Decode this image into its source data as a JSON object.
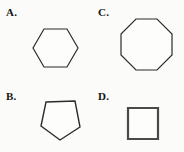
{
  "page": {
    "background_color": "#fbfbfa",
    "width": 184,
    "height": 152,
    "layout": "2x2 multiple-choice polygon grid"
  },
  "choices": [
    {
      "id": "a",
      "label": "A.",
      "shape_name": "hexagon",
      "sides": 6,
      "orientation": "flat-top, vertices at left and right",
      "stroke_color": "#2b2b2b",
      "fill_color": "#fdfdfc",
      "stroke_width": 1.2,
      "box": {
        "x": 33,
        "y": 29,
        "width": 46,
        "height": 38
      },
      "points": "11,0 34,0 45,19 34,38 11,38 0,19"
    },
    {
      "id": "c",
      "label": "C.",
      "shape_name": "octagon",
      "sides": 8,
      "orientation": "flat-top regular octagon",
      "stroke_color": "#2b2b2b",
      "fill_color": "#fdfdfc",
      "stroke_width": 1.2,
      "box": {
        "x": 121,
        "y": 19,
        "width": 51,
        "height": 51
      },
      "points": "15,0 36,0 51,15 51,36 36,51 15,51 0,36 0,15"
    },
    {
      "id": "b",
      "label": "B.",
      "shape_name": "pentagon",
      "sides": 5,
      "orientation": "flat top, apex pointing down",
      "stroke_color": "#2b2b2b",
      "fill_color": "#fdfdfc",
      "stroke_width": 1.4,
      "box": {
        "x": 128,
        "y": 108,
        "width": 39,
        "height": 39
      },
      "points": "5,1 34,0 39,26 19,39 0,25"
    },
    {
      "id": "d",
      "label": "D.",
      "shape_name": "square",
      "sides": 4,
      "orientation": "axis-aligned",
      "stroke_color": "#4a4a4a",
      "fill_color": "#fdfdfc",
      "stroke_width": 2.2,
      "box": {
        "x": 128,
        "y": 108,
        "width": 30,
        "height": 31
      },
      "points": "0,0 30,0 30,31 0,31"
    }
  ]
}
